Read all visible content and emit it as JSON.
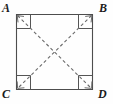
{
  "figure": {
    "kind": "geometry-diagram",
    "background_color": "#fefefe",
    "stroke_color": "#4d4d4d",
    "dash_color": "#6b6b6b",
    "label_color": "#1b1b1b",
    "vertices": [
      {
        "name": "A",
        "label": "A",
        "position": "top-left",
        "x": 16,
        "y": 14
      },
      {
        "name": "B",
        "label": "B",
        "position": "top-right",
        "x": 93,
        "y": 14
      },
      {
        "name": "C",
        "label": "C",
        "position": "bottom-left",
        "x": 16,
        "y": 90
      },
      {
        "name": "D",
        "label": "D",
        "position": "bottom-right",
        "x": 93,
        "y": 90
      }
    ],
    "sides": [
      {
        "name": "AB",
        "from": "A",
        "to": "B",
        "style": "solid"
      },
      {
        "name": "BD",
        "from": "B",
        "to": "D",
        "style": "solid"
      },
      {
        "name": "DC",
        "from": "D",
        "to": "C",
        "style": "solid"
      },
      {
        "name": "CA",
        "from": "C",
        "to": "A",
        "style": "solid"
      }
    ],
    "diagonals": [
      {
        "name": "AD",
        "from": "A",
        "to": "D",
        "style": "dashed"
      },
      {
        "name": "BC",
        "from": "B",
        "to": "C",
        "style": "dashed"
      }
    ],
    "right_angle_markers": [
      {
        "at": "A",
        "size": 14
      },
      {
        "at": "B",
        "size": 14
      },
      {
        "at": "C",
        "size": 14
      },
      {
        "at": "D",
        "size": 14
      }
    ]
  }
}
